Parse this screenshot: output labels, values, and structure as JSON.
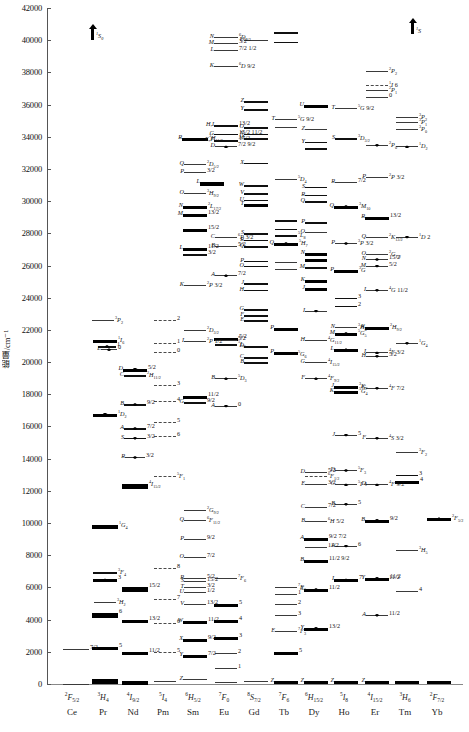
{
  "chart_data": {
    "type": "scatter",
    "ylabel": "能量/cm⁻¹",
    "ylim": [
      0,
      42000
    ],
    "ytick_step": 2000,
    "yticks": [
      "0",
      "2000",
      "4000",
      "6000",
      "8000",
      "10000",
      "12000",
      "14000",
      "16000",
      "18000",
      "20000",
      "22000",
      "24000",
      "26000",
      "28000",
      "30000",
      "32000",
      "34000",
      "36000",
      "38000",
      "40000",
      "42000"
    ],
    "grid": false,
    "legend": null,
    "categories": [
      "Ce",
      "Pr",
      "Nd",
      "Pm",
      "Sm",
      "Eu",
      "Gd",
      "Tb",
      "Dy",
      "Ho",
      "Er",
      "Tm",
      "Yb"
    ],
    "note": "Each column shows the 4f-electron energy manifolds of one trivalent lanthanide ion; bar thickness indicates crystal-field splitting width, letters A..Z label manifolds in order of increasing energy, and right-hand superscript/subscript text gives the spectroscopic term with its J value."
  },
  "axis": {
    "ylabel": "能量/cm⁻¹",
    "ticks": [
      "42000",
      "40000",
      "38000",
      "36000",
      "34000",
      "32000",
      "30000",
      "28000",
      "26000",
      "24000",
      "22000",
      "20000",
      "18000",
      "16000",
      "14000",
      "12000",
      "10000",
      "8000",
      "6000",
      "4000",
      "2000",
      "0"
    ]
  },
  "columns": [
    {
      "name": "Ce",
      "term_sup": "2",
      "term_letter": "F",
      "term_sub": "5/2"
    },
    {
      "name": "Pr",
      "term_sup": "3",
      "term_letter": "H",
      "term_sub": "4"
    },
    {
      "name": "Nd",
      "term_sup": "4",
      "term_letter": "I",
      "term_sub": "9/2"
    },
    {
      "name": "Pm",
      "term_sup": "5",
      "term_letter": "I",
      "term_sub": "4"
    },
    {
      "name": "Sm",
      "term_sup": "6",
      "term_letter": "H",
      "term_sub": "5/2"
    },
    {
      "name": "Eu",
      "term_sup": "7",
      "term_letter": "F",
      "term_sub": "0"
    },
    {
      "name": "Gd",
      "term_sup": "8",
      "term_letter": "S",
      "term_sub": "7/2"
    },
    {
      "name": "Tb",
      "term_sup": "7",
      "term_letter": "F",
      "term_sub": "6"
    },
    {
      "name": "Dy",
      "term_sup": "6",
      "term_letter": "H",
      "term_sub": "15/2"
    },
    {
      "name": "Ho",
      "term_sup": "5",
      "term_letter": "I",
      "term_sub": "8"
    },
    {
      "name": "Er",
      "term_sup": "4",
      "term_letter": "I",
      "term_sub": "15/2"
    },
    {
      "name": "Tm",
      "term_sup": "3",
      "term_letter": "H",
      "term_sub": "6"
    },
    {
      "name": "Yb",
      "term_sup": "2",
      "term_letter": "F",
      "term_sub": "7/2"
    }
  ],
  "annotations": {
    "ce": [
      {
        "label": "7/2",
        "energy": 2200
      }
    ],
    "pr_terms": [
      "3P2",
      "3P1",
      "3P0",
      "1D2",
      "1G4",
      "3F4",
      "3F3",
      "3F2",
      "3H6",
      "3H5",
      "3H4"
    ],
    "nd_terms": [
      "2G7/2",
      "2H11/2",
      "4G9/2",
      "4S3/2",
      "2H9/2",
      "4F3/2",
      "4I15/2",
      "4I13/2",
      "4I11/2",
      "4I9/2"
    ],
    "sm_terms": [
      "6F11/2",
      "6H15/2",
      "6F9/2",
      "6F7/2",
      "6F5/2",
      "6H13/2",
      "6H11/2",
      "6H9/2",
      "6H7/2",
      "6H5/2",
      "4G5/2"
    ],
    "eu_terms": [
      "5D4",
      "5D3",
      "5D2",
      "5D1",
      "5D0",
      "7F6",
      "7F5",
      "7F4",
      "7F3",
      "7F2",
      "7F1",
      "7F0"
    ],
    "gd_terms": [
      "6P7/2",
      "6P5/2",
      "6P3/2",
      "6I7/2",
      "6D9/2",
      "8S7/2"
    ],
    "tb_terms": [
      "5D4",
      "5D3",
      "5G6",
      "7F0",
      "7F1",
      "7F2",
      "7F3",
      "7F4",
      "7F5",
      "7F6"
    ],
    "dy_terms": [
      "4F9/2",
      "4I15/2",
      "4G11/2",
      "6F1/2",
      "6F3/2",
      "6F5/2",
      "6F7/2",
      "6F9/2",
      "6F11/2",
      "6H5/2",
      "6H7/2",
      "6H9/2",
      "6H11/2",
      "6H13/2",
      "6H15/2"
    ],
    "ho_terms": [
      "5G5",
      "5G6",
      "3K8",
      "5F1",
      "5F2",
      "5F3",
      "5F4",
      "5S2",
      "5F5",
      "5I4",
      "5I5",
      "5I6",
      "5I7",
      "5I8"
    ],
    "er_terms": [
      "2H9/2",
      "4F3/2",
      "4F5/2",
      "4F7/2",
      "2H11/2",
      "4S3/2",
      "4F9/2",
      "4I9/2",
      "4I11/2",
      "4I13/2",
      "4I15/2"
    ],
    "tm_terms": [
      "1D2",
      "1G4",
      "3F2",
      "3F3",
      "3H4",
      "3H5",
      "3F4",
      "3H6"
    ],
    "yb_terms": [
      "2F5/2",
      "2F7/2"
    ]
  },
  "markers": {
    "up_arrow_left": "1S0",
    "up_arrow_right": "1S",
    "letters": [
      "A",
      "B",
      "C",
      "D",
      "E",
      "F",
      "G",
      "H",
      "I",
      "J",
      "K",
      "L",
      "M",
      "N",
      "O",
      "P",
      "Q",
      "R",
      "S",
      "T",
      "U",
      "V",
      "W",
      "X",
      "Y",
      "Z"
    ]
  }
}
